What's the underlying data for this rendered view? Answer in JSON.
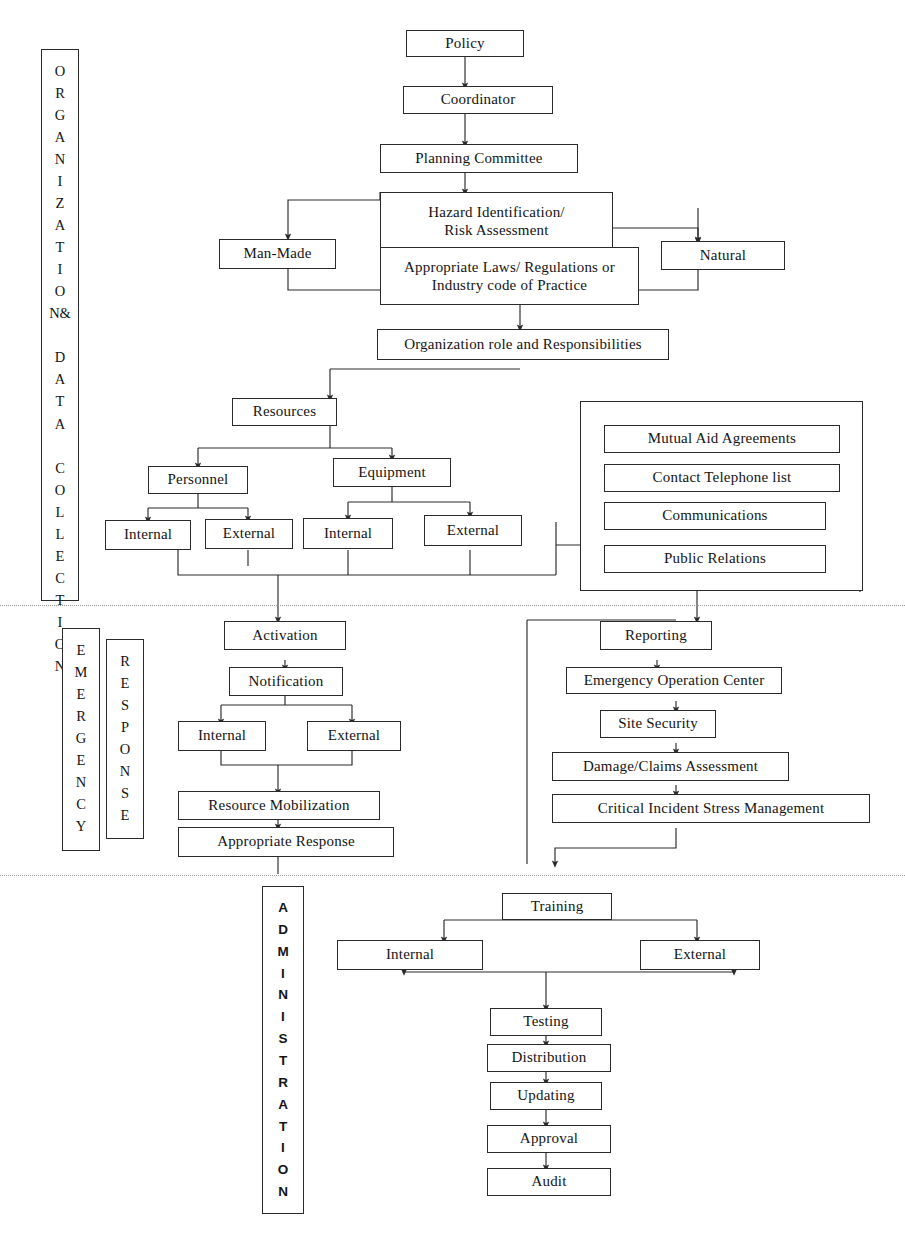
{
  "diagram": {
    "line_color": "#2a2a2a",
    "background": "#ffffff",
    "divider_color": "#9a9a9a"
  },
  "bands": [
    {
      "id": "band-organization",
      "name": "ORGANIZATION & DATA COLLECTION",
      "letters": "O\nR\nG\nA\nN\nI\nZ\nA\nT\nI\nO\nN&\n\nD\nA\nT\nA\n\nC\nO\nL\nL\nE\nC\nT\nI\nO\nN"
    },
    {
      "id": "band-emergency",
      "name": "EMERGENCY",
      "letters": "E\nM\nE\nR\nG\nE\nN\nC\nY"
    },
    {
      "id": "band-response",
      "name": "RESPONSE",
      "letters": "R\nE\nS\nP\nO\nN\nS\nE"
    },
    {
      "id": "band-administration",
      "name": "ADMINISTRATION",
      "letters": "A\nD\nM\nI\nN\nI\nS\nT\nR\nA\nT\nI\nO\nN"
    }
  ],
  "nodes": {
    "policy": "Policy",
    "coordinator": "Coordinator",
    "planning_committee": "Planning Committee",
    "hazard_identification": "Hazard Identification/\nRisk Assessment",
    "man_made": "Man-Made",
    "natural": "Natural",
    "appropriate_laws": "Appropriate Laws/ Regulations or\nIndustry code of Practice",
    "organization_role": "Organization role and Responsibilities",
    "resources": "Resources",
    "personnel": "Personnel",
    "equipment": "Equipment",
    "personnel_internal": "Internal",
    "personnel_external": "External",
    "equipment_internal": "Internal",
    "equipment_external": "External",
    "mutual_aid": "Mutual Aid Agreements",
    "contact_list": "Contact Telephone list",
    "communications": "Communications",
    "public_relations": "Public Relations",
    "activation": "Activation",
    "notification": "Notification",
    "notify_internal": "Internal",
    "notify_external": "External",
    "resource_mobilization": "Resource Mobilization",
    "appropriate_response": "Appropriate Response",
    "reporting": "Reporting",
    "eoc": "Emergency Operation Center",
    "site_security": "Site Security",
    "damage_claims": "Damage/Claims Assessment",
    "cism": "Critical Incident Stress Management",
    "training": "Training",
    "training_internal": "Internal",
    "training_external": "External",
    "testing": "Testing",
    "distribution": "Distribution",
    "updating": "Updating",
    "approval": "Approval",
    "audit": "Audit"
  },
  "caption": {
    "text": ""
  }
}
